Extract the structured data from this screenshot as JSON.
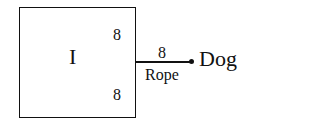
{
  "diagram": {
    "box": {
      "label": "I",
      "top_value": "8",
      "bottom_value": "8"
    },
    "rope": {
      "value": "8",
      "label": "Rope"
    },
    "endpoint": {
      "label": "Dog"
    }
  }
}
